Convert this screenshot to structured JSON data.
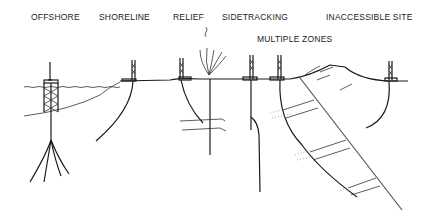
{
  "diagram": {
    "labels": {
      "offshore": "OFFSHORE",
      "shoreline": "SHORELINE",
      "relief": "RELIEF",
      "sidetracking": "SIDETRACKING",
      "multiple_zones": "MULTIPLE ZONES",
      "inaccessible_site": "INACCESSIBLE SITE"
    },
    "colors": {
      "line": "#1a1a1a",
      "background": "#ffffff"
    }
  }
}
